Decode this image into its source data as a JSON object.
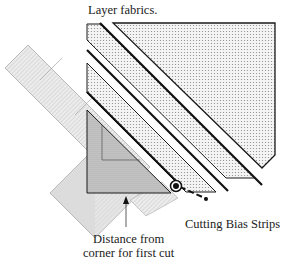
{
  "labels": {
    "title": "Layer fabrics.",
    "cutting_bias_strips": "Cutting Bias Strips",
    "distance_line1": "Distance from",
    "distance_line2": "corner for first cut"
  },
  "colors": {
    "outline": "#1a1a1a",
    "fabric_fill": "#e4e4e4",
    "ruler_fill": "#d9d9d9",
    "background": "#ffffff"
  }
}
